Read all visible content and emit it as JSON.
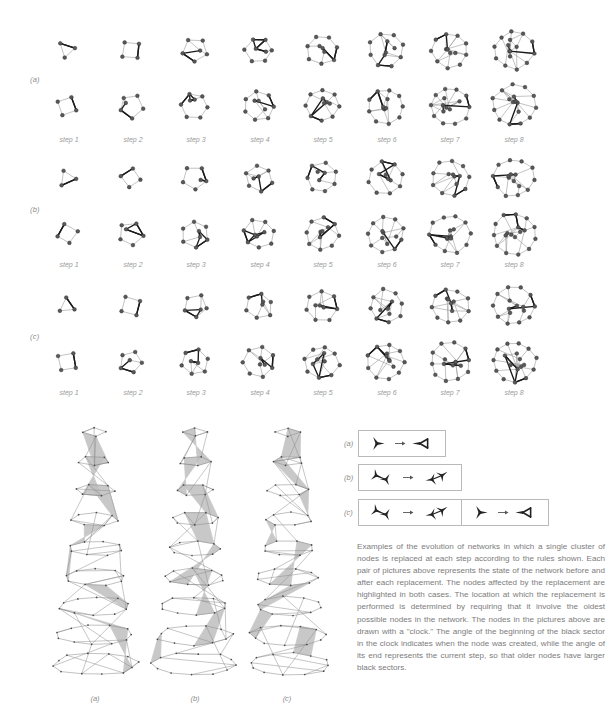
{
  "figure": {
    "type": "scientific-figure",
    "domain": "network-evolution-diagram",
    "row_labels": [
      "(a)",
      "(b)",
      "(c)"
    ],
    "step_labels": [
      "step 1",
      "step 2",
      "step 3",
      "step 4",
      "step 5",
      "step 6",
      "step 7",
      "step 8"
    ],
    "column_labels": [
      "(a)",
      "(b)",
      "(c)"
    ],
    "rule_labels": [
      "(a)",
      "(b)",
      "(c)"
    ],
    "caption": "Examples of the evolution of networks in which a single cluster of nodes is replaced at each step according to the rules shown. Each pair of pictures above represents the state of the network before and after each replacement. The nodes affected by the replacement are highlighted in both cases. The location at which the replacement is performed is determined by requiring that it involve the oldest possible nodes in the network. The nodes in the pictures above are drawn with a \"clock.\" The angle of the beginning of the black sector in the clock indicates when the node was created, while the angle of its end represents the current step, so that older nodes have larger black sectors.",
    "colors": {
      "node_fill": "#595959",
      "node_stroke": "#2b2b2b",
      "edge_light": "#9a9a9a",
      "edge_highlight": "#1a1a1a",
      "text": "#7c7c7c",
      "box_border": "#b9b9b9",
      "column_edge": "#8d8d8d",
      "column_highlight": "#bfbfbf",
      "background": "#ffffff"
    },
    "rules": [
      {
        "label": "(a)",
        "box_count": 1,
        "boxes": [
          {
            "lhs": "3-node Y cluster (single node with three edges)",
            "arrow": "→",
            "rhs": "triangle with one tail edge"
          }
        ]
      },
      {
        "label": "(b)",
        "box_count": 1,
        "boxes": [
          {
            "lhs": "two joined Y clusters (H / bowtie shape)",
            "arrow": "→",
            "rhs": "two joined Y clusters rotated"
          }
        ]
      },
      {
        "label": "(c)",
        "box_count": 2,
        "boxes": [
          {
            "lhs": "two joined Y clusters (H / bowtie shape)",
            "arrow": "→",
            "rhs": "two joined Y clusters rotated"
          },
          {
            "lhs": "3-node Y cluster (single node with three edges)",
            "arrow": "→",
            "rhs": "triangle with one tail edge"
          }
        ]
      }
    ],
    "network_rows": [
      {
        "label": "(a)",
        "sub_rows": [
          "before",
          "after"
        ],
        "steps": 8,
        "node_counts_before": [
          4,
          6,
          8,
          10,
          12,
          14,
          16,
          18
        ]
      },
      {
        "label": "(b)",
        "sub_rows": [
          "before",
          "after"
        ],
        "steps": 8,
        "node_counts_before": [
          4,
          6,
          8,
          10,
          12,
          14,
          16,
          18
        ]
      },
      {
        "label": "(c)",
        "sub_rows": [
          "before",
          "after"
        ],
        "steps": 8,
        "node_counts_before": [
          4,
          6,
          8,
          10,
          12,
          14,
          16,
          18
        ]
      }
    ],
    "columns_3d": [
      {
        "label": "(a)",
        "layers": 9,
        "description": "stacked 3D network evolution column"
      },
      {
        "label": "(b)",
        "layers": 9,
        "description": "stacked 3D network evolution column"
      },
      {
        "label": "(c)",
        "layers": 9,
        "description": "stacked 3D network evolution column"
      }
    ]
  }
}
